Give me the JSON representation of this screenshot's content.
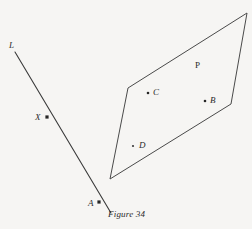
{
  "figure": {
    "caption": "Figure 34",
    "caption_pos": {
      "x": 108,
      "y": 209
    },
    "background_color": "#f6f5f3",
    "ink_color": "#3a3a3a",
    "width": 252,
    "height": 229
  },
  "line": {
    "name": "L",
    "label": "L",
    "label_pos": {
      "x": 9,
      "y": 41
    },
    "start": {
      "x": 15,
      "y": 52
    },
    "end": {
      "x": 111,
      "y": 213
    },
    "stroke": "#3a3a3a",
    "stroke_width": 1.1
  },
  "plane": {
    "name": "P",
    "label": "P",
    "label_pos": {
      "x": 195,
      "y": 61
    },
    "vertices": [
      {
        "x": 128,
        "y": 88
      },
      {
        "x": 247,
        "y": 13
      },
      {
        "x": 231,
        "y": 104
      },
      {
        "x": 110,
        "y": 179
      }
    ],
    "stroke": "#4a4a4a",
    "stroke_width": 1.0,
    "fill": "none"
  },
  "points": [
    {
      "label": "X",
      "dot": {
        "x": 47,
        "y": 117
      },
      "label_pos": {
        "x": 35,
        "y": 113
      },
      "marker": "square",
      "on": "line"
    },
    {
      "label": "A",
      "dot": {
        "x": 99,
        "y": 202
      },
      "label_pos": {
        "x": 88,
        "y": 199
      },
      "marker": "square",
      "on": "line"
    },
    {
      "label": "C",
      "dot": {
        "x": 148,
        "y": 93
      },
      "label_pos": {
        "x": 153,
        "y": 88
      },
      "marker": "dot",
      "on": "plane"
    },
    {
      "label": "B",
      "dot": {
        "x": 205,
        "y": 101
      },
      "label_pos": {
        "x": 210,
        "y": 96
      },
      "marker": "dot",
      "on": "plane"
    },
    {
      "label": "D",
      "dot": {
        "x": 133,
        "y": 146
      },
      "label_pos": {
        "x": 139,
        "y": 141
      },
      "marker": "dot",
      "on": "plane"
    }
  ]
}
